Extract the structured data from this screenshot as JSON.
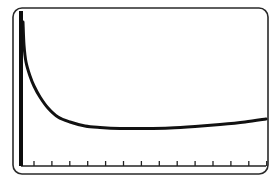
{
  "chart_data": {
    "type": "line",
    "title": "",
    "xlabel": "",
    "ylabel": "",
    "grid": false,
    "legend": null,
    "x_tick_count": 14,
    "x_tick_labels": [],
    "y_tick_labels": [],
    "series": [
      {
        "name": "curve",
        "color": "#111111",
        "points_px": [
          [
            23,
            22
          ],
          [
            24,
            45
          ],
          [
            26,
            62
          ],
          [
            30,
            76
          ],
          [
            34,
            86
          ],
          [
            40,
            97
          ],
          [
            48,
            108
          ],
          [
            58,
            117
          ],
          [
            70,
            122
          ],
          [
            85,
            126
          ],
          [
            100,
            127.5
          ],
          [
            120,
            128.5
          ],
          [
            145,
            128.5
          ],
          [
            170,
            128
          ],
          [
            195,
            126.5
          ],
          [
            220,
            124.5
          ],
          [
            245,
            122
          ],
          [
            266,
            119
          ]
        ]
      }
    ],
    "frame": {
      "x": 13,
      "y": 8,
      "width": 255,
      "height": 166,
      "radius": 9
    },
    "y_axis": {
      "x": 21,
      "y_top": 11,
      "y_bottom": 166,
      "thickness": 4
    },
    "x_axis": {
      "y": 166,
      "x_start": 21,
      "x_end": 266,
      "tick_start": 34,
      "tick_spacing": 17.9,
      "tick_length": 5
    }
  }
}
